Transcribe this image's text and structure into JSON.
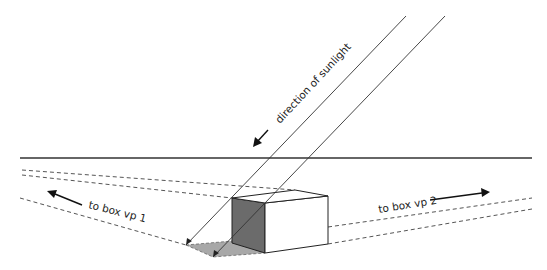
{
  "diagram": {
    "type": "two-point perspective shadow construction",
    "labels": {
      "sunlight": "direction of sunlight",
      "vp1": "to box vp 1",
      "vp2": "to box vp 2"
    },
    "colors": {
      "line": "#222222",
      "dashed": "#555555",
      "shaded_face": "#6b6b6b",
      "shadow": "#a8a8a8",
      "background": "#ffffff"
    },
    "elements": {
      "horizon_line": "horizon",
      "box": "cube in two-point perspective",
      "sun_rays": 2,
      "vanishing_guides": 5
    }
  }
}
